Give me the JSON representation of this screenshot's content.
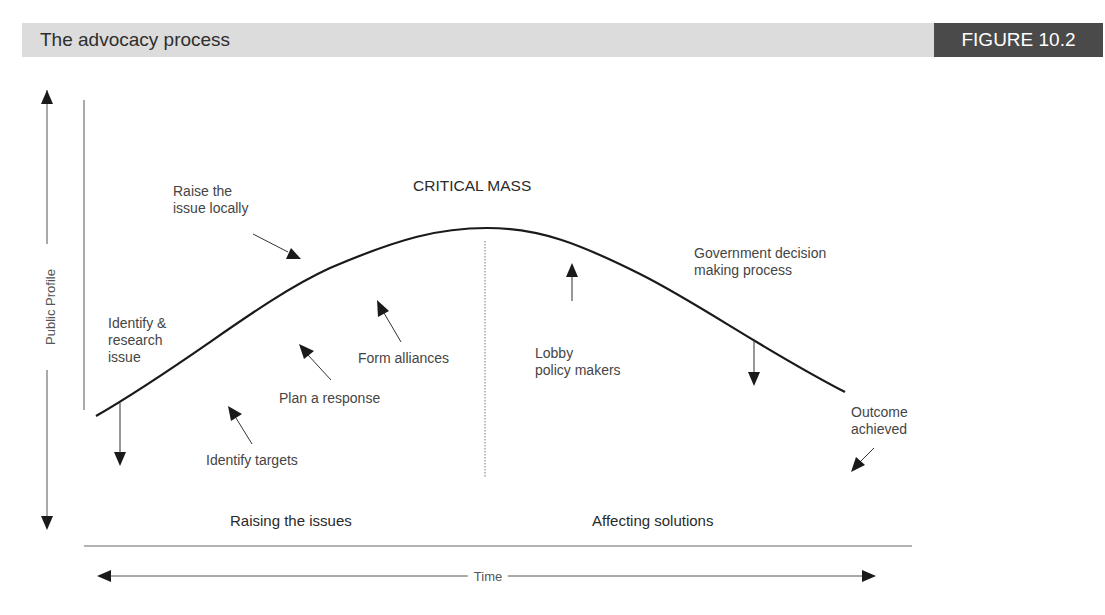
{
  "header": {
    "title": "The advocacy process",
    "figure_label": "FIGURE 10.2"
  },
  "axes": {
    "y_label": "Public Profile",
    "x_label": "Time"
  },
  "peak_label": "CRITICAL MASS",
  "phases": {
    "left": "Raising the issues",
    "right": "Affecting solutions"
  },
  "steps": [
    {
      "lines": [
        "Identify &",
        "research",
        "issue"
      ],
      "arrow": "down"
    },
    {
      "lines": [
        "Identify targets"
      ],
      "arrow": "up-left"
    },
    {
      "lines": [
        "Plan a response"
      ],
      "arrow": "up-left"
    },
    {
      "lines": [
        "Form alliances"
      ],
      "arrow": "up-left"
    },
    {
      "lines": [
        "Raise the",
        "issue locally"
      ],
      "arrow": "down-right"
    },
    {
      "lines": [
        "Lobby",
        "policy makers"
      ],
      "arrow": "up"
    },
    {
      "lines": [
        "Government decision",
        "making process"
      ],
      "arrow": "down"
    },
    {
      "lines": [
        "Outcome",
        "achieved"
      ],
      "arrow": "down-left"
    }
  ],
  "colors": {
    "header_band": "#dcdcdc",
    "figure_tag": "#4a4a4a",
    "curve": "#1a1a1a",
    "arrow": "#1a1a1a"
  }
}
